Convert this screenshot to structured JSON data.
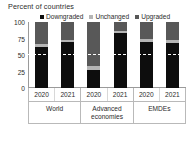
{
  "chart_data": {
    "type": "bar",
    "title": "Percent of countries",
    "subtitle": "",
    "xlabel": "",
    "ylabel": "",
    "ylim": [
      0,
      100
    ],
    "yticks": [
      0,
      25,
      50,
      75,
      100
    ],
    "grid": false,
    "stacked": true,
    "legend_position": "top",
    "reference_line": {
      "value": 50,
      "style": "dashed",
      "color": "#ffffff"
    },
    "groups": [
      "World",
      "Advanced economies",
      "EMDEs"
    ],
    "categories": [
      "2020",
      "2021",
      "2020",
      "2021",
      "2020",
      "2021"
    ],
    "series": [
      {
        "name": "Downgraded",
        "color": "#0d0d0d",
        "values": [
          62,
          70,
          27,
          83,
          70,
          68
        ]
      },
      {
        "name": "Unchanged",
        "color": "#b5b5b5",
        "values": [
          5,
          3,
          6,
          4,
          5,
          5
        ]
      },
      {
        "name": "Upgraded",
        "color": "#585858",
        "values": [
          33,
          27,
          67,
          13,
          25,
          27
        ]
      }
    ]
  },
  "legend": {
    "items": [
      {
        "label": "Downgraded",
        "color": "#0d0d0d",
        "icon": "square-marker-icon"
      },
      {
        "label": "Unchanged",
        "color": "#b5b5b5",
        "icon": "square-marker-icon"
      },
      {
        "label": "Upgraded",
        "color": "#585858",
        "icon": "square-marker-icon"
      }
    ]
  },
  "axis": {
    "y_ticks": [
      "100",
      "75",
      "50",
      "25",
      "0"
    ],
    "x_labels": [
      "2020",
      "2021",
      "2020",
      "2021",
      "2020",
      "2021"
    ],
    "group_labels": [
      "World",
      "Advanced economies",
      "EMDEs"
    ]
  },
  "colors": {
    "downgraded": "#0d0d0d",
    "unchanged": "#b5b5b5",
    "upgraded": "#585858",
    "axis": "#9a9a9a",
    "text": "#2b2b2b",
    "background": "#ffffff"
  }
}
